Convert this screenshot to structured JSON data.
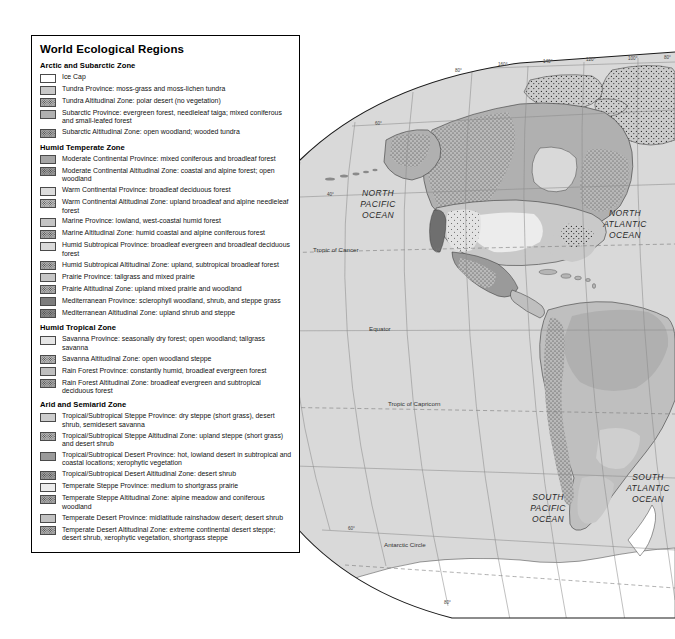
{
  "legend": {
    "title": "World Ecological Regions",
    "groups": [
      {
        "heading": "Arctic and Subarctic Zone",
        "items": [
          {
            "label": "Ice Cap",
            "color": "#ffffff",
            "pattern": false
          },
          {
            "label": "Tundra Province: moss-grass and moss-lichen tundra",
            "color": "#c9c9c9",
            "pattern": false
          },
          {
            "label": "Tundra Altitudinal Zone: polar desert (no vegetation)",
            "color": "#b5b5b5",
            "pattern": true
          },
          {
            "label": "Subarctic Province: evergreen forest, needleleaf taiga; mixed coniferous and small-leafed forest",
            "color": "#b0b0b0",
            "pattern": false
          },
          {
            "label": "Subarctic Altitudinal Zone: open woodland; wooded tundra",
            "color": "#a8a8a8",
            "pattern": true
          }
        ]
      },
      {
        "heading": "Humid Temperate Zone",
        "items": [
          {
            "label": "Moderate Continental Province: mixed coniferous and broadleaf forest",
            "color": "#a6a6a6",
            "pattern": false
          },
          {
            "label": "Moderate Continental Altitudinal Zone: coastal and alpine forest; open woodland",
            "color": "#9e9e9e",
            "pattern": true
          },
          {
            "label": "Warm Continental Province: broadleaf deciduous forest",
            "color": "#dcdcdc",
            "pattern": false
          },
          {
            "label": "Warm Continental Altitudinal Zone: upland broadleaf and alpine needleleaf forest",
            "color": "#c0c0c0",
            "pattern": true
          },
          {
            "label": "Marine Province: lowland, west-coastal humid forest",
            "color": "#c4c4c4",
            "pattern": false
          },
          {
            "label": "Marine Altitudinal Zone: humid coastal and alpine coniferous forest",
            "color": "#aeaeae",
            "pattern": true
          },
          {
            "label": "Humid Subtropical Province: broadleaf evergreen and broadleaf deciduous forest",
            "color": "#dadada",
            "pattern": false
          },
          {
            "label": "Humid Subtropical Altitudinal Zone: upland, subtropical broadleaf forest",
            "color": "#b2b2b2",
            "pattern": true
          },
          {
            "label": "Prairie Province: tallgrass and mixed prairie",
            "color": "#c6c6c6",
            "pattern": false
          },
          {
            "label": "Prairie Altitudinal Zone: upland mixed prairie and woodland",
            "color": "#b4b4b4",
            "pattern": true
          },
          {
            "label": "Mediterranean Province: sclerophyll woodland, shrub, and steppe grass",
            "color": "#7d7d7d",
            "pattern": false
          },
          {
            "label": "Mediterranean Altitudinal Zone: upland shrub and steppe",
            "color": "#8c8c8c",
            "pattern": true
          }
        ]
      },
      {
        "heading": "Humid Tropical Zone",
        "items": [
          {
            "label": "Savanna Province: seasonally dry forest; open woodland; tallgrass savanna",
            "color": "#e6e6e6",
            "pattern": false
          },
          {
            "label": "Savanna Altitudinal Zone: open woodland steppe",
            "color": "#bcbcbc",
            "pattern": true
          },
          {
            "label": "Rain Forest Province: constantly humid, broadleaf evergreen forest",
            "color": "#bfbfbf",
            "pattern": false
          },
          {
            "label": "Rain Forest Altitudinal Zone: broadleaf evergreen and subtropical deciduous forest",
            "color": "#a9a9a9",
            "pattern": true
          }
        ]
      },
      {
        "heading": "Arid and Semiarid Zone",
        "items": [
          {
            "label": "Tropical/Subtropical Steppe Province: dry steppe (short grass), desert shrub, semidesert savanna",
            "color": "#cdcdcd",
            "pattern": false
          },
          {
            "label": "Tropical/Subtropical Steppe Altitudinal Zone: upland steppe (short grass) and desert shrub",
            "color": "#b6b6b6",
            "pattern": true
          },
          {
            "label": "Tropical/Subtropical Desert Province: hot, lowland desert in subtropical and coastal locations; xerophytic vegetation",
            "color": "#9a9a9a",
            "pattern": false
          },
          {
            "label": "Tropical/Subtropical Desert Altitudinal Zone: desert shrub",
            "color": "#a0a0a0",
            "pattern": true
          },
          {
            "label": "Temperate Steppe Province: medium to shortgrass prairie",
            "color": "#ececec",
            "pattern": false
          },
          {
            "label": "Temperate Steppe Altitudinal Zone: alpine meadow and coniferous woodland",
            "color": "#adadad",
            "pattern": true
          },
          {
            "label": "Temperate Desert Province: midlatitude rainshadow desert; desert shrub",
            "color": "#c2c2c2",
            "pattern": false
          },
          {
            "label": "Temperate Desert Altitudinal Zone: extreme continental desert steppe; desert shrub, xerophytic vegetation, shortgrass steppe",
            "color": "#b1b1b1",
            "pattern": true
          }
        ]
      }
    ]
  },
  "map": {
    "ocean_labels": [
      {
        "lines": [
          "NORTH",
          "PACIFIC",
          "OCEAN"
        ],
        "x": 378,
        "y": 196
      },
      {
        "lines": [
          "NORTH",
          "ATLANTIC",
          "OCEAN"
        ],
        "x": 625,
        "y": 216
      },
      {
        "lines": [
          "SOUTH",
          "PACIFIC",
          "OCEAN"
        ],
        "x": 548,
        "y": 500
      },
      {
        "lines": [
          "SOUTH",
          "ATLANTIC",
          "OCEAN"
        ],
        "x": 648,
        "y": 480
      }
    ],
    "latitude_labels": [
      {
        "label": "Tropic of Cancer",
        "x": 313,
        "y": 252
      },
      {
        "label": "Equator",
        "x": 369,
        "y": 331
      },
      {
        "label": "Tropic of Capricorn",
        "x": 388,
        "y": 406
      },
      {
        "label": "Antarctic Circle",
        "x": 384,
        "y": 547
      }
    ],
    "longitude_labels": [
      {
        "label": "160°",
        "x": 498,
        "y": 66
      },
      {
        "label": "140°",
        "x": 543,
        "y": 63
      },
      {
        "label": "120°",
        "x": 586,
        "y": 61
      },
      {
        "label": "100°",
        "x": 628,
        "y": 60
      },
      {
        "label": "80°",
        "x": 664,
        "y": 59
      }
    ],
    "minor_latitude_labels": [
      {
        "label": "80°",
        "x": 455,
        "y": 72
      },
      {
        "label": "60°",
        "x": 375,
        "y": 125
      },
      {
        "label": "40°",
        "x": 327,
        "y": 196
      },
      {
        "label": "60°",
        "x": 348,
        "y": 530
      },
      {
        "label": "80°",
        "x": 444,
        "y": 604
      }
    ],
    "ice_color": "#ffffff",
    "ocean_color": "#d9d9d9",
    "outline_color": "#1a1a1a"
  }
}
